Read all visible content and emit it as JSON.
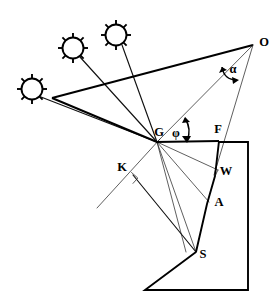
{
  "figure": {
    "kind": "line-diagram",
    "background_color": "#ffffff",
    "line_color": "#000000",
    "width": 279,
    "height": 307
  },
  "labels": {
    "observer": "O",
    "angle_alpha": "α",
    "ground_vertex": "G",
    "angle_phi": "φ",
    "front": "F",
    "wall": "W",
    "point_a": "A",
    "point_s": "S",
    "point_k": "K"
  },
  "points": {
    "O": {
      "x": 253,
      "y": 45,
      "label": "O"
    },
    "G": {
      "x": 157,
      "y": 142,
      "label": "G"
    },
    "F": {
      "x": 217,
      "y": 140,
      "label": "F"
    },
    "W": {
      "x": 218,
      "y": 171,
      "label": "W"
    },
    "A": {
      "x": 209,
      "y": 202,
      "label": "A"
    },
    "S": {
      "x": 196,
      "y": 252,
      "label": "S"
    },
    "K": {
      "x": 133,
      "y": 179,
      "label": "K"
    },
    "apex_left": {
      "x": 52,
      "y": 98,
      "label": ""
    }
  },
  "suns": [
    {
      "name": "sun-left",
      "cx": 32,
      "cy": 89,
      "r": 11,
      "rays": 8
    },
    {
      "name": "sun-middle",
      "cx": 73,
      "cy": 48,
      "r": 11,
      "rays": 8
    },
    {
      "name": "sun-right",
      "cx": 116,
      "cy": 35,
      "r": 11,
      "rays": 8
    }
  ],
  "angles": {
    "alpha": {
      "label": "α",
      "label_x": 233,
      "label_y": 70,
      "vertex": "O"
    },
    "phi": {
      "label": "φ",
      "label_x": 176,
      "label_y": 134,
      "vertex": "G"
    }
  },
  "markers": {
    "right_angle_at_K": {
      "x": 136,
      "y": 178,
      "size": 9
    }
  },
  "label_positions": {
    "O": {
      "x": 264,
      "y": 43
    },
    "G": {
      "x": 159,
      "y": 133
    },
    "F": {
      "x": 218,
      "y": 130
    },
    "W": {
      "x": 226,
      "y": 172
    },
    "A": {
      "x": 219,
      "y": 203
    },
    "S": {
      "x": 203,
      "y": 255
    },
    "K": {
      "x": 122,
      "y": 168
    }
  }
}
